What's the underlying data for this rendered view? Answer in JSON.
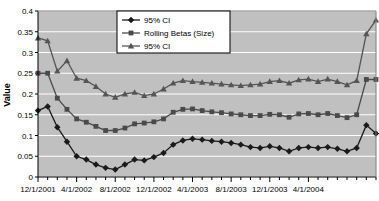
{
  "chart_data": {
    "type": "line",
    "title": "",
    "xlabel": "",
    "ylabel": "Value",
    "ylim": [
      0,
      0.4
    ],
    "ytick_labels": [
      "0.4",
      "0.35",
      "0.3",
      "0.25",
      "0.2",
      "0.15",
      "0.1",
      "0.05",
      "0"
    ],
    "ytick_values": [
      0.4,
      0.35,
      0.3,
      0.25,
      0.2,
      0.15,
      0.1,
      0.05,
      0
    ],
    "xtick_labels": [
      "12/1/2001",
      "4/1/2002",
      "8/1/2002",
      "12/1/2002",
      "4/1/2003",
      "8/1/2003",
      "12/1/2003",
      "4/1/2004"
    ],
    "xtick_indices": [
      0,
      4,
      8,
      12,
      16,
      20,
      24,
      28
    ],
    "x_count": 29,
    "grid": true,
    "legend_position": "top-right",
    "plot_background": "#c0c0c0",
    "gridline_color": "#ffffff",
    "series": [
      {
        "name": "95% CI",
        "marker": "diamond",
        "color": "#1a1a1a",
        "values": [
          0.16,
          0.17,
          0.12,
          0.085,
          0.05,
          0.042,
          0.03,
          0.022,
          0.018,
          0.03,
          0.042,
          0.04,
          0.048,
          0.058,
          0.078,
          0.088,
          0.092,
          0.09,
          0.087,
          0.085,
          0.082,
          0.078,
          0.072,
          0.07,
          0.074,
          0.07,
          0.062,
          0.07,
          0.072,
          0.07,
          0.072,
          0.068,
          0.062,
          0.07,
          0.125,
          0.105
        ]
      },
      {
        "name": "Rolling Betas (Size)",
        "marker": "square",
        "color": "#4a4a4a",
        "values": [
          0.25,
          0.25,
          0.19,
          0.163,
          0.14,
          0.132,
          0.122,
          0.112,
          0.112,
          0.118,
          0.128,
          0.13,
          0.133,
          0.14,
          0.156,
          0.163,
          0.164,
          0.16,
          0.157,
          0.155,
          0.152,
          0.15,
          0.148,
          0.148,
          0.151,
          0.15,
          0.144,
          0.152,
          0.153,
          0.15,
          0.153,
          0.148,
          0.143,
          0.15,
          0.235,
          0.235
        ]
      },
      {
        "name": "95% CI",
        "marker": "triangle",
        "color": "#555555",
        "values": [
          0.335,
          0.328,
          0.255,
          0.28,
          0.238,
          0.232,
          0.218,
          0.2,
          0.192,
          0.2,
          0.204,
          0.196,
          0.2,
          0.212,
          0.226,
          0.232,
          0.23,
          0.228,
          0.226,
          0.224,
          0.222,
          0.22,
          0.222,
          0.224,
          0.23,
          0.232,
          0.226,
          0.234,
          0.236,
          0.23,
          0.236,
          0.23,
          0.222,
          0.232,
          0.345,
          0.378
        ]
      }
    ],
    "legend_entries": [
      {
        "label": "95% CI",
        "marker": "diamond",
        "color": "#1a1a1a"
      },
      {
        "label": "Rolling Betas (Size)",
        "marker": "square",
        "color": "#4a4a4a"
      },
      {
        "label": "95% CI",
        "marker": "triangle",
        "color": "#555555"
      }
    ]
  }
}
